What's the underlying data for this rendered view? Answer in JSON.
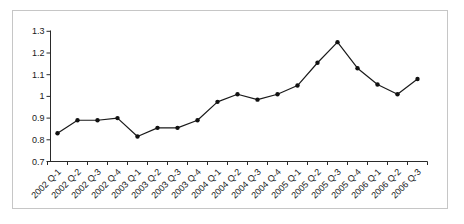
{
  "chart_data": {
    "type": "line",
    "title": "",
    "xlabel": "",
    "ylabel": "",
    "categories": [
      "2002 Q-1",
      "2002 Q-2",
      "2002 Q-3",
      "2002 Q-4",
      "2003 Q-1",
      "2003 Q-2",
      "2003 Q-3",
      "2003 Q-4",
      "2004 Q-1",
      "2004 Q-2",
      "2004 Q-3",
      "2004 Q-4",
      "2005 Q-1",
      "2005 Q-2",
      "2005 Q-3",
      "2005 Q-4",
      "2006 Q-1",
      "2006 Q-2",
      "2006 Q-3"
    ],
    "values": [
      0.83,
      0.89,
      0.89,
      0.9,
      0.815,
      0.855,
      0.855,
      0.89,
      0.975,
      1.01,
      0.985,
      1.01,
      1.05,
      1.155,
      1.25,
      1.13,
      1.055,
      1.01,
      1.08
    ],
    "ylim": [
      0.7,
      1.3
    ],
    "ytick_labels": [
      "0.7",
      "0.8",
      "0.9",
      "1",
      "1.1",
      "1.2",
      "1.3"
    ],
    "ytick_values": [
      0.7,
      0.8,
      0.9,
      1.0,
      1.1,
      1.2,
      1.3
    ],
    "grid": false,
    "legend_position": "none",
    "colors": {
      "line": "#1a1a1a",
      "marker": "#111111",
      "axis": "#2a2a2a",
      "label": "#1a1a1a",
      "frame_border": "#c6c6c6",
      "background": "#ffffff"
    },
    "marker_style": "filled-dot"
  }
}
